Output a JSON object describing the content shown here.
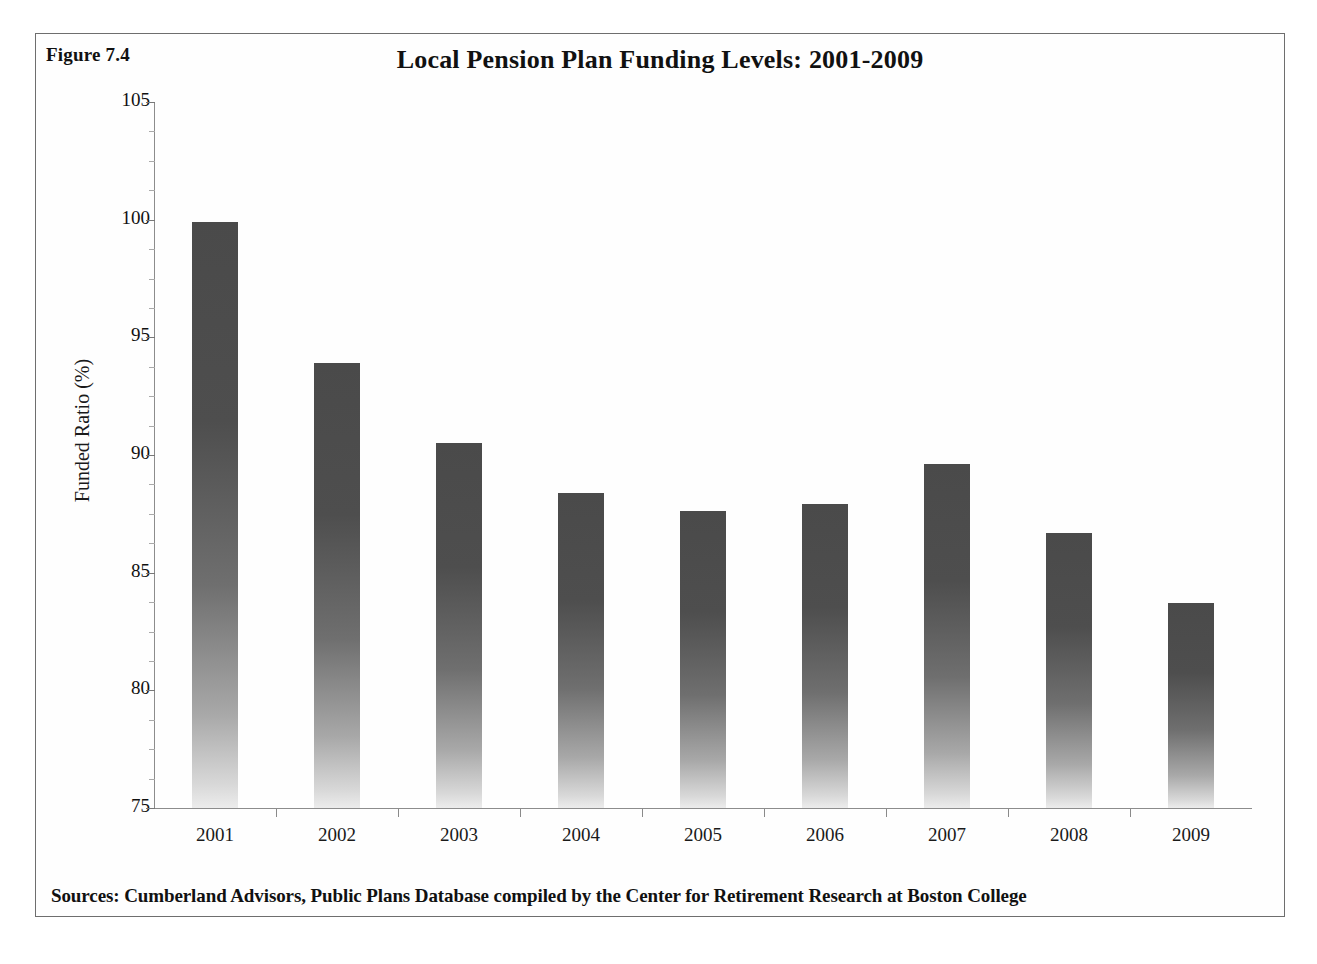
{
  "figure": {
    "number_label": "Figure 7.4",
    "source_note": "Sources: Cumberland Advisors, Public Plans Database compiled by the Center for Retirement Research at Boston College",
    "frame_color": "#6e6e6e",
    "background_color": "#ffffff"
  },
  "chart_data": {
    "type": "bar",
    "title": "Local Pension Plan Funding Levels: 2001-2009",
    "xlabel": "",
    "ylabel": "Funded Ratio (%)",
    "categories": [
      "2001",
      "2002",
      "2003",
      "2004",
      "2005",
      "2006",
      "2007",
      "2008",
      "2009"
    ],
    "values": [
      99.9,
      93.9,
      90.5,
      88.4,
      87.6,
      87.9,
      89.6,
      86.7,
      83.7
    ],
    "ylim": [
      75,
      105
    ],
    "ytick_values": [
      105,
      100,
      95,
      90,
      85,
      80,
      75
    ],
    "ytick_labels": [
      "105",
      "100",
      "95",
      "90",
      "85",
      "80",
      "75"
    ],
    "yminor_step": 1.25,
    "grid": false,
    "legend": false,
    "bar_color_top": "#4a4a4a",
    "bar_color_bottom": "#ececec",
    "axis_color": "#8c8c8c"
  }
}
